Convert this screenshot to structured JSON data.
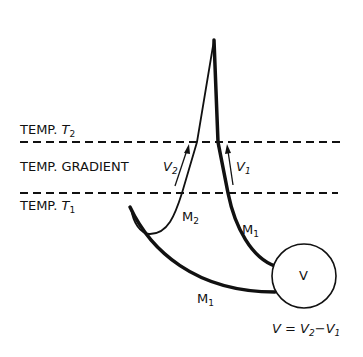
{
  "diagram": {
    "labels": {
      "temp_t2": "TEMP.",
      "temp_t2_sym": "T",
      "temp_t2_sub": "2",
      "temp_gradient": "TEMP. GRADIENT",
      "temp_t1": "TEMP.",
      "temp_t1_sym": "T",
      "temp_t1_sub": "1",
      "v2_sym": "V",
      "v2_sub": "2",
      "v1_sym": "V",
      "v1_sub": "1",
      "m2_sym": "M",
      "m2_sub": "2",
      "m1_right_sym": "M",
      "m1_right_sub": "1",
      "m1_bottom_sym": "M",
      "m1_bottom_sub": "1",
      "voltmeter": "V",
      "equation_lhs": "V",
      "equation_eq": " = ",
      "equation_v2": "V",
      "equation_v2_sub": "2",
      "equation_minus": "−",
      "equation_v1": "V",
      "equation_v1_sub": "1"
    },
    "colors": {
      "ink": "#111111",
      "background": "#ffffff"
    }
  }
}
